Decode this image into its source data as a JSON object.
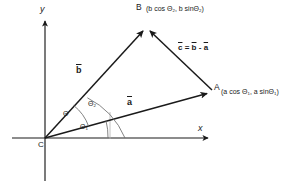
{
  "figure": {
    "type": "vector-triangle-diagram",
    "background_color": "#ffffff",
    "stroke_color": "#1a1a1a",
    "faint_stroke_color": "#9a9a9a",
    "width": 291,
    "height": 185
  },
  "axes": {
    "x_label": "x",
    "y_label": "y",
    "origin_label": "C"
  },
  "points": {
    "B": {
      "label": "B",
      "coords_text": "(b cos Θ₂ , b sinΘ₂)",
      "x_expr": "b cos Θ",
      "x_sub": "2",
      "y_expr": "b sinΘ",
      "y_sub": "2"
    },
    "A": {
      "label": "A",
      "coords_text": "(a cos Θ₁ , a sinΘ₁)",
      "x_expr": "a cos Θ",
      "x_sub": "1",
      "y_expr": "a sinΘ",
      "y_sub": "1"
    }
  },
  "vectors": {
    "a": {
      "label": "a",
      "overline": true
    },
    "b": {
      "label": "b",
      "overline": true
    },
    "c": {
      "label": "c",
      "overline": true
    }
  },
  "equation": {
    "lhs": "c",
    "eq": "=",
    "term1": "b",
    "minus": "-",
    "term2": "a",
    "full_text": "c̅ = b̅ - a̅"
  },
  "angles": {
    "theta1": {
      "symbol": "Θ",
      "sub": "1",
      "text": "Θ₁"
    },
    "theta": {
      "symbol": "Θ",
      "sub": "",
      "text": "Θ"
    },
    "theta2": {
      "symbol": "Θ",
      "sub": "2",
      "text": "Θ₂"
    }
  }
}
